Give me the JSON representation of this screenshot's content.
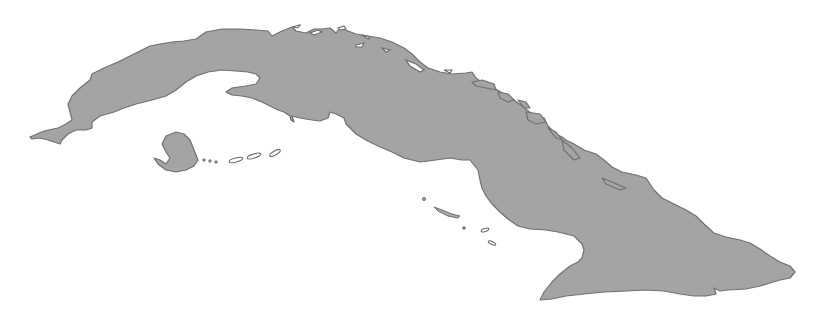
{
  "map": {
    "subject": "Cuba",
    "style": "gray silhouette",
    "colors": {
      "land": "#a4a4a4",
      "coastline": "#6f6f6f",
      "water": "#ffffff"
    },
    "features": [
      "main-island",
      "isla-de-la-juventud",
      "northern-cays",
      "southern-cays"
    ]
  }
}
